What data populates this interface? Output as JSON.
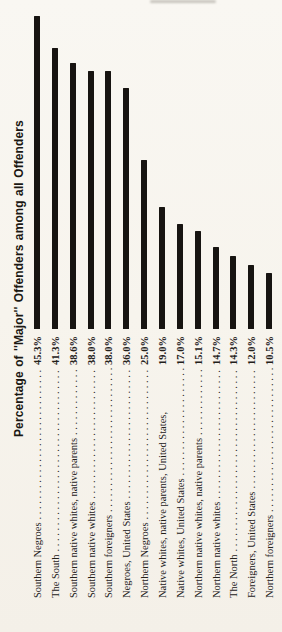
{
  "title": "Percentage of ''Major'' Offenders among all Offenders",
  "leader_dots": ". . . . . . . . . . . . . . . . . . . . . . . . . . . . . . . . . . . . . . . .",
  "colors": {
    "bar": "#171411",
    "paper": "#f7f4ed",
    "text": "#23201a"
  },
  "chart_data": {
    "type": "bar",
    "orientation": "rotated-90-ccw-page",
    "title": "Percentage of ''Major'' Offenders among all Offenders",
    "xlabel": "",
    "ylabel": "Percentage of ''Major'' Offenders among all Offenders",
    "ylim": [
      0,
      47
    ],
    "grid": false,
    "legend": "none",
    "categories": [
      "Southern Negroes",
      "The South",
      "Southern native whites, native parents",
      "Southern native whites",
      "Southern foreigners",
      "Negroes, United States",
      "Northern Negroes",
      "Native whites, native parents, United States,",
      "Native whites, United States",
      "Northern native whites, native parents",
      "Northern native whites",
      "The North",
      "Foreigners, United States",
      "Northern foreigners"
    ],
    "values": [
      45.3,
      41.3,
      38.6,
      38.0,
      38.0,
      36.0,
      25.0,
      19.0,
      17.0,
      15.1,
      14.7,
      14.3,
      12.0,
      10.5
    ],
    "value_labels": [
      "45.3%",
      "41.3%",
      "38.6%",
      "38.0%",
      "38.0%",
      "36.0%",
      "25.0%",
      "19.0%",
      "17.0%",
      "15.1%",
      "14.7%",
      "14.3%",
      "12.0%",
      "10.5%"
    ],
    "dot_leaders": [
      true,
      true,
      true,
      true,
      true,
      true,
      true,
      false,
      true,
      true,
      true,
      true,
      true,
      true
    ],
    "layout": {
      "baseline_y": 329,
      "bar_width": 6,
      "bar_centers_x": [
        37,
        55,
        73,
        91,
        108,
        126,
        144,
        162,
        180,
        198,
        216,
        233,
        251,
        269
      ],
      "bar_heights_px": [
        313,
        281,
        266,
        258,
        258,
        241,
        169,
        122,
        105,
        98,
        82,
        73,
        64,
        56
      ],
      "label_bottom_y": 598,
      "label_length": 262,
      "label_line_h": 13,
      "title_left": 12,
      "title_bottom_y": 437,
      "title_length": 342,
      "title_line_h": 16
    }
  }
}
